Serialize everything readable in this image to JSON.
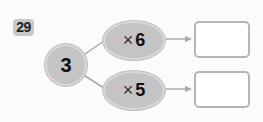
{
  "problem": {
    "number": "29",
    "start_value": "3",
    "operations": [
      {
        "operator": "×",
        "operand": "6",
        "answer": ""
      },
      {
        "operator": "×",
        "operand": "5",
        "answer": ""
      }
    ]
  },
  "colors": {
    "node_fill": "#c4c4c4",
    "line": "#a8a8a8",
    "box_border": "#b5b5b5"
  }
}
